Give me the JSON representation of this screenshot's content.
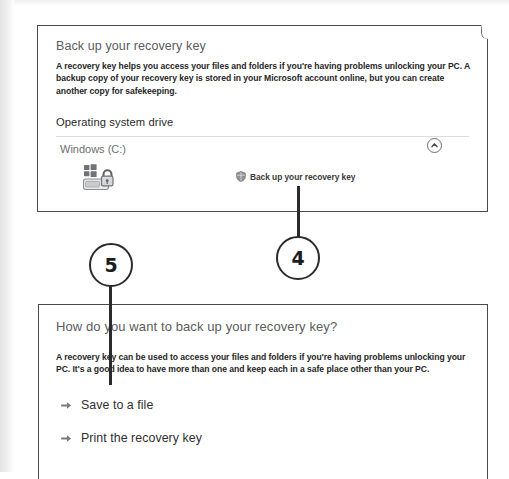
{
  "figure": {
    "callouts": [
      {
        "number": "4",
        "target": "back-up-your-recovery-key-link"
      },
      {
        "number": "5",
        "target": "how-do-you-want-to-back-up-your-recovery-key-heading"
      }
    ]
  },
  "panel_one": {
    "heading": "Back up your recovery key",
    "body": "A recovery key helps you access your files and folders if you're having problems unlocking your PC. A backup copy of your recovery key is stored in your Microsoft account online, but you can create another copy for safekeeping.",
    "section": {
      "title": "Operating system drive",
      "drive_label": "Windows (C:)",
      "collapse_icon": "chevron-up-icon",
      "drive_icon": "bitlocker-drive-unlocked-icon",
      "action": {
        "icon": "shield-icon",
        "label": "Back up your recovery key"
      }
    }
  },
  "panel_two": {
    "heading": "How do you want to back up your recovery key?",
    "body": "A recovery key can be used to access your files and folders if you're having problems unlocking your PC. It's a good idea to have more than one and keep each in a safe place other than your PC.",
    "options": [
      {
        "icon": "arrow-right-icon",
        "label": "Save to a file"
      },
      {
        "icon": "arrow-right-icon",
        "label": "Print the recovery key"
      }
    ]
  },
  "colors": {
    "heading": "#5a5c5e",
    "body_text": "#262626",
    "panel_border": "#4a4a4a",
    "callout_ink": "#1d1d1d"
  }
}
